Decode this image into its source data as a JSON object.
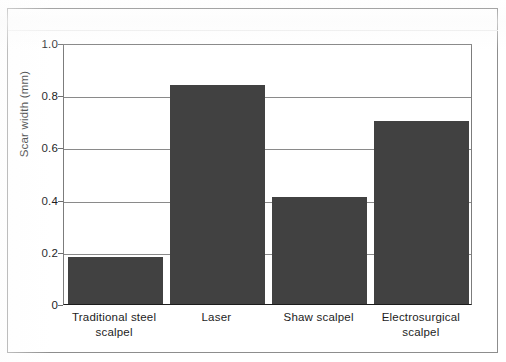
{
  "figure": {
    "frame_color": "#8d8d8d",
    "background": "#ffffff"
  },
  "chart_data": {
    "type": "bar",
    "title": "",
    "xlabel": "",
    "ylabel": "Scar width (mm)",
    "categories": [
      "Traditional steel scalpel",
      "Laser",
      "Shaw scalpel",
      "Electrosurgical scalpel"
    ],
    "category_lines": [
      [
        "Traditional steel",
        "scalpel"
      ],
      [
        "Laser",
        ""
      ],
      [
        "Shaw scalpel",
        ""
      ],
      [
        "Electrosurgical",
        "scalpel"
      ]
    ],
    "values": [
      0.18,
      0.84,
      0.41,
      0.7
    ],
    "ylim": [
      0,
      1.0
    ],
    "yticks": [
      0,
      0.2,
      0.4,
      0.6,
      0.8,
      1.0
    ],
    "ytick_labels": [
      "0",
      "0.2",
      "0.4",
      "0.6",
      "0.8",
      "1.0"
    ],
    "grid": true,
    "legend": "none",
    "bar_color": "#414141",
    "axis_color": "#1c1c1c",
    "gridline_color": "#8a8a8a"
  }
}
